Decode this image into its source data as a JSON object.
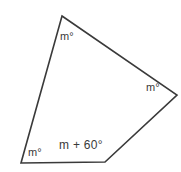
{
  "figure": {
    "name": "quadrilateral-angle-diagram",
    "shape": "quadrilateral",
    "stroke_color": "#3a3a3a",
    "fill_color": "#ffffff",
    "background_color": "#ffffff",
    "vertices": [
      {
        "id": "top",
        "x": 62,
        "y": 16
      },
      {
        "id": "right",
        "x": 177,
        "y": 95
      },
      {
        "id": "bottom-right",
        "x": 105,
        "y": 162
      },
      {
        "id": "bottom-left",
        "x": 21,
        "y": 163
      }
    ],
    "labels": {
      "top_angle": "m°",
      "right_angle": "m°",
      "bottom_left_angle": "m°",
      "bottom_edge_angle": "m + 60°"
    }
  }
}
